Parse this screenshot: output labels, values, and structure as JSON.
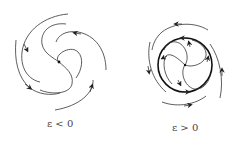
{
  "figure": {
    "panels": [
      {
        "id": "left",
        "label": "ε < 0",
        "description": "stable focus: trajectories spiral inward to the fixed point",
        "center": [
          59,
          62
        ]
      },
      {
        "id": "right",
        "label": "ε > 0",
        "description": "stable limit cycle: inner trajectories spiral outward, outer trajectories spiral inward",
        "center": [
          185,
          65
        ],
        "limit_cycle_radius": 27
      }
    ],
    "colors": {
      "stroke": "#222222",
      "label": "#444444",
      "background": "#ffffff"
    }
  }
}
